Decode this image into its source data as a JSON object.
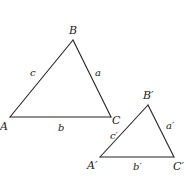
{
  "diagram": {
    "stroke_color": "#222222",
    "background": "#ffffff",
    "triangles": [
      {
        "id": "ABC",
        "vertices": {
          "A": "A",
          "B": "B",
          "C": "C"
        },
        "sides": {
          "a": "a",
          "b": "b",
          "c": "c"
        }
      },
      {
        "id": "A'B'C'",
        "vertices": {
          "A": "A′",
          "B": "B′",
          "C": "C′"
        },
        "sides": {
          "a": "a′",
          "b": "b′",
          "c": "c′"
        }
      }
    ]
  }
}
